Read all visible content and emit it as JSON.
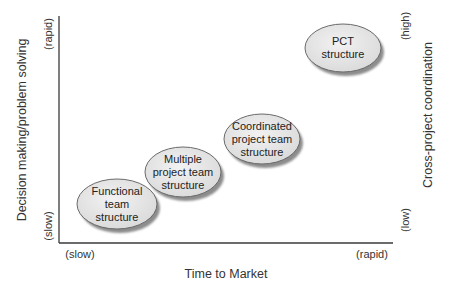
{
  "diagram": {
    "type": "positioning-map",
    "x_axis": {
      "title": "Time to Market",
      "low_label": "(slow)",
      "high_label": "(rapid)"
    },
    "y_axis_left": {
      "title": "Decision making/problem solving",
      "low_label": "(slow)",
      "high_label": "(rapid)"
    },
    "y_axis_right": {
      "title": "Cross-project coordination",
      "low_label": "(low)",
      "high_label": "(high)"
    },
    "nodes": [
      {
        "id": "functional",
        "lines": [
          "Functional",
          "team",
          "structure"
        ]
      },
      {
        "id": "multiple",
        "lines": [
          "Multiple",
          "project team",
          "structure"
        ]
      },
      {
        "id": "coordinated",
        "lines": [
          "Coordinated",
          "project team",
          "structure"
        ]
      },
      {
        "id": "pct",
        "lines": [
          "PCT",
          "structure"
        ]
      }
    ],
    "colors": {
      "ellipse_fill": "#e6e6e6",
      "ellipse_stroke": "#6a6a6a",
      "shadow": "#8c8c8c",
      "axis": "#3a3a3a",
      "text": "#2a2a2a"
    }
  }
}
